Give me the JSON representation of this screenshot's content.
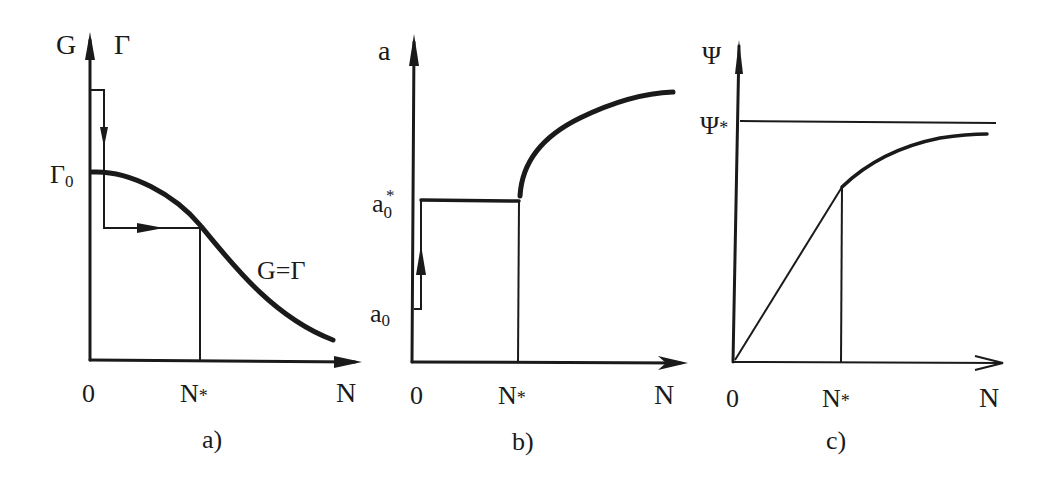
{
  "panels": [
    {
      "id": "a",
      "caption": "a)",
      "y_axis_label_left": "G",
      "y_axis_label_right": "Γ",
      "x_axis_label": "N",
      "origin_label": "0",
      "x_marker_label": "N",
      "x_marker_sub": "*",
      "y_marker_label": "Γ",
      "y_marker_sub": "0",
      "curve_label": "G=Γ"
    },
    {
      "id": "b",
      "caption": "b)",
      "y_axis_label": "a",
      "x_axis_label": "N",
      "origin_label": "0",
      "x_marker_label": "N",
      "x_marker_sub": "*",
      "y_marker_low_label": "a",
      "y_marker_low_sub": "0",
      "y_marker_high_label": "a",
      "y_marker_high_sub": "0",
      "y_marker_high_sup": "*"
    },
    {
      "id": "c",
      "caption": "c)",
      "y_axis_label": "Ψ",
      "x_axis_label": "N",
      "origin_label": "0",
      "x_marker_label": "N",
      "x_marker_sub": "*",
      "asymptote_label": "Ψ",
      "asymptote_sub": "*"
    }
  ],
  "colors": {
    "ink": "#1a1a1a",
    "background": "#ffffff"
  }
}
